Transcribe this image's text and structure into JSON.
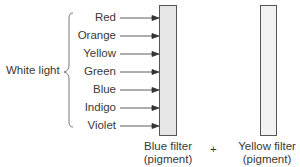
{
  "diagram": {
    "group_label": "White light",
    "colors": [
      "Red",
      "Orange",
      "Yellow",
      "Green",
      "Blue",
      "Indigo",
      "Violet"
    ],
    "filters": [
      {
        "label_line1": "Blue filter",
        "label_line2": "(pigment)"
      },
      {
        "label_line1": "Yellow filter",
        "label_line2": "(pigment)"
      }
    ],
    "operator": "+",
    "filter_fill": "#e6e6e6",
    "filter_stroke": "#555555"
  }
}
